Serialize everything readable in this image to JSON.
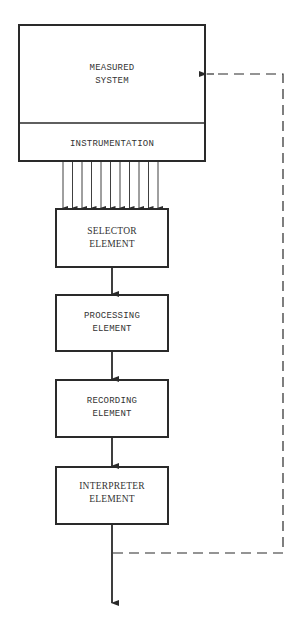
{
  "diagram": {
    "type": "block-flow",
    "stroke_color": "#2a2a2a",
    "text_color": "#333333",
    "measured_system": {
      "label_line1": "MEASURED",
      "label_line2": "SYSTEM"
    },
    "instrumentation": {
      "label": "INSTRUMENTATION"
    },
    "signal_arrows_count": 11,
    "blocks": [
      {
        "id": "selector",
        "line1": "SELECTOR",
        "line2": "ELEMENT"
      },
      {
        "id": "processing",
        "line1": "PROCESSING",
        "line2": "ELEMENT"
      },
      {
        "id": "recording",
        "line1": "RECORDING",
        "line2": "ELEMENT"
      },
      {
        "id": "interpreter",
        "line1": "INTERPRETER",
        "line2": "ELEMENT"
      }
    ],
    "feedback": {
      "style": "dashed",
      "from": "interpreter-output",
      "to": "measured-system"
    }
  }
}
